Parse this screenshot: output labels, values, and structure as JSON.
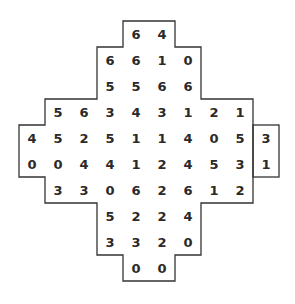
{
  "puzzle": {
    "type": "number-grid",
    "origin": {
      "x": 19,
      "y": 21
    },
    "cell_size": 26,
    "colors": {
      "line": "#333333",
      "text": "#2a2a2a",
      "background": "#ffffff"
    },
    "rows": [
      {
        "start_col": 4,
        "values": [
          6,
          4
        ]
      },
      {
        "start_col": 3,
        "values": [
          6,
          6,
          1,
          0
        ]
      },
      {
        "start_col": 3,
        "values": [
          5,
          5,
          6,
          6
        ]
      },
      {
        "start_col": 1,
        "values": [
          5,
          6,
          3,
          4,
          3,
          1,
          2,
          1
        ]
      },
      {
        "start_col": 0,
        "values": [
          4,
          5,
          2,
          5,
          1,
          1,
          4,
          0,
          5,
          3
        ]
      },
      {
        "start_col": 0,
        "values": [
          0,
          0,
          4,
          4,
          1,
          2,
          4,
          5,
          3,
          1
        ]
      },
      {
        "start_col": 1,
        "values": [
          3,
          3,
          0,
          6,
          2,
          6,
          1,
          2
        ]
      },
      {
        "start_col": 3,
        "values": [
          5,
          2,
          2,
          4
        ]
      },
      {
        "start_col": 3,
        "values": [
          3,
          3,
          2,
          0
        ]
      },
      {
        "start_col": 4,
        "values": [
          0,
          0
        ]
      }
    ],
    "main_outline_cols_per_row": [
      [
        4,
        5
      ],
      [
        3,
        6
      ],
      [
        3,
        6
      ],
      [
        1,
        8
      ],
      [
        0,
        8
      ],
      [
        0,
        8
      ],
      [
        1,
        8
      ],
      [
        3,
        6
      ],
      [
        3,
        6
      ],
      [
        4,
        5
      ]
    ],
    "side_box": {
      "col": 9,
      "rows": [
        4,
        5
      ]
    }
  }
}
